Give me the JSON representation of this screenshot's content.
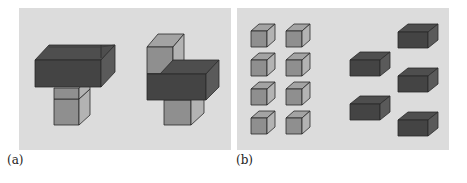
{
  "figure": {
    "panels": [
      {
        "id": "a",
        "label": "(a)",
        "description": "Two stacked block arrangements: dark wide blocks combined with light cubes",
        "background": "#dcdcdc"
      },
      {
        "id": "b",
        "label": "(b)",
        "description": "Eight separate light cubes in a 2x4 grid and five separate dark wide blocks",
        "background": "#dcdcdc",
        "light_cube_count": 8,
        "dark_block_count": 5
      }
    ],
    "colors": {
      "light_front": "#8f8f8f",
      "light_top": "#a3a3a3",
      "light_side": "#b3b3b3",
      "dark_front": "#444444",
      "dark_top": "#4e4e4e",
      "dark_side": "#5a5a5a",
      "edge": "#2a2a2a"
    }
  }
}
